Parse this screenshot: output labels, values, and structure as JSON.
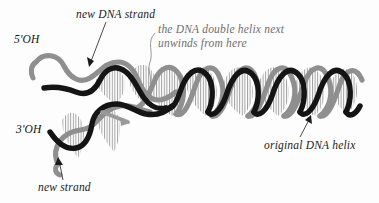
{
  "figure": {
    "background_color": "#fdfdfd"
  },
  "colors": {
    "new_strand": "#141414",
    "original_strand": "#8f8f8f",
    "base_pairs": "#9a9a9a",
    "annotation_gray": "#6e6e6e",
    "annotation_dark": "#1b1b1b",
    "leader_line": "#4a4a4a"
  },
  "labels": {
    "new_dna_strand": "new DNA strand",
    "unwinds_note_line1": "the DNA double helix next",
    "unwinds_note_line2": "unwinds from here",
    "five_prime_oh": "5'OH",
    "three_prime_oh": "3'OH",
    "new_strand": "new strand",
    "original_dna_helix": "original DNA helix"
  },
  "elements": {
    "upper_fork_new_strand": "black-wavy-strand-upper",
    "upper_fork_template_strand": "gray-wavy-strand-upper",
    "lower_fork_new_strand": "black-wavy-strand-lower",
    "lower_fork_template_strand": "gray-wavy-strand-lower",
    "duplex_new_strand": "black-helix-strand-right",
    "duplex_template_strand": "gray-helix-strand-right",
    "base_pair_rungs": "vertical-hatch-base-pairs",
    "synthesis_direction_arrow": "gray-arrow-right"
  },
  "leaders": {
    "new_dna_strand_arrow": "arrow-down-left-to-black-strand",
    "unwinds_note_leader": "curved-line-to-fork-junction",
    "new_strand_arrow": "arrow-up-to-gray-strand",
    "original_dna_helix_leader": "line-up-to-helix"
  }
}
